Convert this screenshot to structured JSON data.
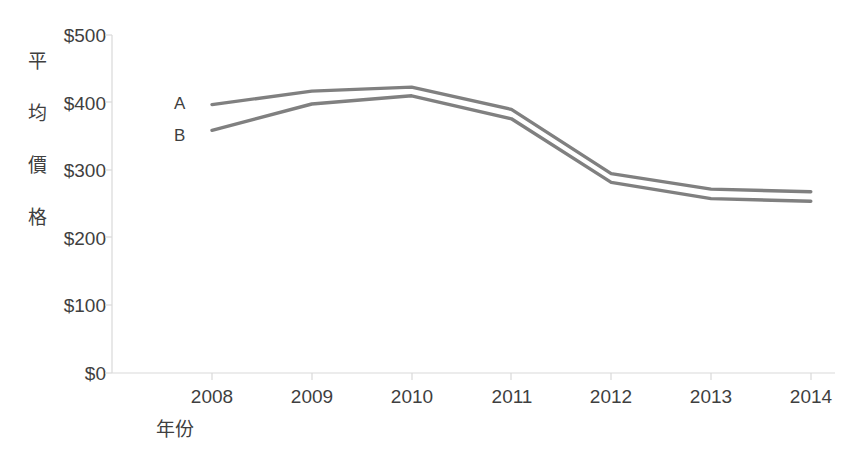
{
  "chart_data": {
    "type": "line",
    "title": "",
    "xlabel": "年份",
    "ylabel": "平均價格",
    "ylabel_chars": [
      "平",
      "均",
      "價",
      "格"
    ],
    "categories": [
      "2008",
      "2009",
      "2010",
      "2011",
      "2012",
      "2013",
      "2014"
    ],
    "x": [
      2008,
      2009,
      2010,
      2011,
      2012,
      2013,
      2014
    ],
    "series": [
      {
        "name": "A",
        "values": [
          397,
          417,
          423,
          390,
          295,
          272,
          268
        ],
        "color": "#808080"
      },
      {
        "name": "B",
        "values": [
          359,
          398,
          410,
          376,
          282,
          258,
          254
        ],
        "color": "#808080"
      }
    ],
    "ylim": [
      0,
      500
    ],
    "ytick_values": [
      0,
      100,
      200,
      300,
      400,
      500
    ],
    "ytick_labels": [
      "$0",
      "$100",
      "$200",
      "$300",
      "$400",
      "$500"
    ],
    "grid": false,
    "legend_position": "inline-left",
    "axis_color": "#d9d9d9",
    "text_color": "#3f3f3f"
  },
  "axis": {
    "y_labels": [
      {
        "text": "$500",
        "value": 500
      },
      {
        "text": "$400",
        "value": 400
      },
      {
        "text": "$300",
        "value": 300
      },
      {
        "text": "$200",
        "value": 200
      },
      {
        "text": "$100",
        "value": 100
      },
      {
        "text": "$0",
        "value": 0
      }
    ],
    "x_labels": [
      {
        "text": "2008"
      },
      {
        "text": "2009"
      },
      {
        "text": "2010"
      },
      {
        "text": "2011"
      },
      {
        "text": "2012"
      },
      {
        "text": "2013"
      },
      {
        "text": "2014"
      }
    ],
    "y_title_chars": [
      {
        "text": "平"
      },
      {
        "text": "均"
      },
      {
        "text": "價"
      },
      {
        "text": "格"
      }
    ],
    "x_title": "年份"
  },
  "series_labels": [
    {
      "text": "A"
    },
    {
      "text": "B"
    }
  ]
}
